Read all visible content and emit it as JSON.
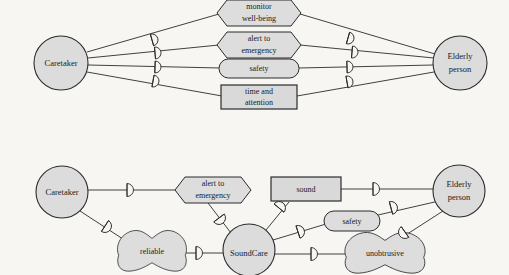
{
  "diagram": {
    "type": "i-star-strategic-dependency-model",
    "background_color": "#f7f6f3",
    "shape_fill_color": "#dddddd",
    "stroke_color": "#2b2b2b",
    "models": [
      {
        "id": "top",
        "name": "caretaker-elderly-dependencies",
        "actors": [
          {
            "id": "caretaker_top",
            "label": "Caretaker",
            "shape": "circle",
            "cx": 61,
            "cy": 63,
            "r": 27
          },
          {
            "id": "elderly_top",
            "label": "Elderly\nperson",
            "line1": "Elderly",
            "line2": "person",
            "shape": "circle",
            "cx": 460,
            "cy": 63,
            "r": 27
          }
        ],
        "elements": [
          {
            "id": "monitor_wellbeing",
            "label": "monitor well-being",
            "line1": "monitor",
            "line2": "well-being",
            "shape": "task-hexagon",
            "cx": 259,
            "cy": 13,
            "w": 82,
            "h": 26
          },
          {
            "id": "alert_to_emergency_top",
            "label": "alert to emergency",
            "line1": "alert to",
            "line2": "emergency",
            "shape": "task-hexagon",
            "cx": 259,
            "cy": 45,
            "w": 82,
            "h": 26
          },
          {
            "id": "safety_top",
            "label": "safety",
            "line1": "safety",
            "line2": "",
            "shape": "goal-rounded",
            "cx": 259,
            "cy": 68,
            "w": 80,
            "h": 19
          },
          {
            "id": "time_and_attention",
            "label": "time and attention",
            "line1": "time and",
            "line2": "attention",
            "shape": "resource-rectangle",
            "cx": 259,
            "cy": 97,
            "w": 76,
            "h": 24
          }
        ],
        "dependency_markers": [
          {
            "side": "left",
            "x": 152,
            "y": 40,
            "angle": 0
          },
          {
            "side": "left",
            "x": 155,
            "y": 52,
            "angle": 0
          },
          {
            "side": "left",
            "x": 155,
            "y": 66,
            "angle": 0
          },
          {
            "side": "left",
            "x": 153,
            "y": 80,
            "angle": 0
          },
          {
            "side": "right",
            "x": 347,
            "y": 38,
            "angle": 0
          },
          {
            "side": "right",
            "x": 352,
            "y": 52,
            "angle": 0
          },
          {
            "side": "right",
            "x": 347,
            "y": 66,
            "angle": 0
          },
          {
            "side": "right",
            "x": 347,
            "y": 81,
            "angle": 0
          }
        ]
      },
      {
        "id": "bottom",
        "name": "soundcare-dependencies",
        "actors": [
          {
            "id": "caretaker_bottom",
            "label": "Caretaker",
            "shape": "circle",
            "cx": 62,
            "cy": 192,
            "r": 26
          },
          {
            "id": "soundcare",
            "label": "SoundCare",
            "shape": "circle",
            "cx": 249,
            "cy": 250,
            "r": 26
          },
          {
            "id": "elderly_bottom",
            "label": "Elderly\nperson",
            "line1": "Elderly",
            "line2": "person",
            "shape": "circle",
            "cx": 459,
            "cy": 191,
            "r": 26
          }
        ],
        "elements": [
          {
            "id": "alert_to_emergency_bottom",
            "label": "alert to emergency",
            "line1": "alert to",
            "line2": "emergency",
            "shape": "task-hexagon",
            "cx": 213,
            "cy": 190,
            "w": 76,
            "h": 26
          },
          {
            "id": "sound",
            "label": "sound",
            "line1": "sound",
            "line2": "",
            "shape": "resource-rectangle",
            "cx": 306,
            "cy": 189,
            "w": 70,
            "h": 24
          },
          {
            "id": "safety_bottom",
            "label": "safety",
            "line1": "safety",
            "line2": "",
            "shape": "goal-rounded",
            "cx": 352,
            "cy": 221,
            "w": 56,
            "h": 19
          },
          {
            "id": "reliable",
            "label": "reliable",
            "shape": "softgoal-cloud",
            "cx": 152,
            "cy": 251,
            "w": 74,
            "h": 42
          },
          {
            "id": "unobtrusive",
            "label": "unobtrusive",
            "shape": "softgoal-cloud",
            "cx": 385,
            "cy": 253,
            "w": 86,
            "h": 42
          }
        ],
        "dependency_markers": [
          {
            "id": "dep_caretaker_alert",
            "x": 127,
            "y": 190,
            "angle": 0
          },
          {
            "id": "dep_alert_soundcare",
            "x": 216,
            "y": 221,
            "angle": 58
          },
          {
            "id": "dep_caretaker_reliable",
            "x": 108,
            "y": 228,
            "angle": 42
          },
          {
            "id": "dep_reliable_soundcare",
            "x": 196,
            "y": 253,
            "angle": 0
          },
          {
            "id": "dep_soundcare_sound",
            "x": 278,
            "y": 208,
            "angle": 50
          },
          {
            "id": "dep_sound_elderly",
            "x": 373,
            "y": 190,
            "angle": 0
          },
          {
            "id": "dep_soundcare_safety",
            "x": 297,
            "y": 233,
            "angle": 25
          },
          {
            "id": "dep_safety_elderly",
            "x": 391,
            "y": 207,
            "angle": 22
          },
          {
            "id": "dep_soundcare_unobtrusive",
            "x": 311,
            "y": 254,
            "angle": 0
          },
          {
            "id": "dep_unobtrusive_elderly",
            "x": 406,
            "y": 232,
            "angle": 140
          }
        ]
      }
    ]
  }
}
